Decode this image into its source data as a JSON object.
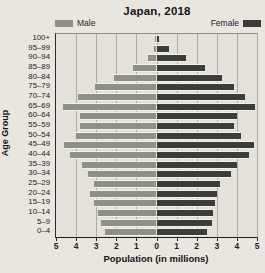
{
  "figure": {
    "width_px": 265,
    "height_px": 273,
    "background_color": "#e9e6e0"
  },
  "chart_data": {
    "type": "bar",
    "subtype": "population-pyramid",
    "title": "Japan, 2018",
    "xlabel": "Population (in millions)",
    "ylabel": "Age Group",
    "x_max_each_side": 5,
    "x_tick_step": 1,
    "x_tick_labels": [
      "5",
      "4",
      "3",
      "2",
      "1",
      "0",
      "1",
      "2",
      "3",
      "4",
      "5"
    ],
    "grid": true,
    "legend_position": "top",
    "categories_top_to_bottom": [
      "100+",
      "95–99",
      "90–94",
      "85–89",
      "80–84",
      "75–79",
      "70–74",
      "65–69",
      "60–64",
      "55–59",
      "50–54",
      "45–49",
      "40–44",
      "35–39",
      "30–34",
      "25–29",
      "20–24",
      "15–19",
      "10–14",
      "5–9",
      "0–4"
    ],
    "series": [
      {
        "name": "Male",
        "side": "left",
        "color": "#8e8f87",
        "values_top_to_bottom": [
          0.05,
          0.1,
          0.4,
          1.15,
          2.1,
          3.05,
          3.9,
          4.65,
          3.8,
          3.8,
          4.0,
          4.6,
          4.3,
          3.7,
          3.4,
          3.1,
          3.3,
          3.1,
          2.9,
          2.75,
          2.55
        ]
      },
      {
        "name": "Female",
        "side": "right",
        "color": "#3c3c3b",
        "values_top_to_bottom": [
          0.1,
          0.6,
          1.45,
          2.4,
          3.25,
          3.85,
          4.4,
          4.9,
          4.0,
          3.85,
          4.2,
          4.85,
          4.6,
          4.0,
          3.7,
          3.15,
          3.0,
          2.9,
          2.8,
          2.75,
          2.5
        ]
      }
    ],
    "colors": {
      "male_bar": "#8e8f87",
      "female_bar": "#3c3c3b",
      "plot_background": "#e4e1da",
      "page_background": "#e9e6e0",
      "gridline": "#abaaa3",
      "axis_line": "#1c1c1a",
      "text": "#161616"
    }
  }
}
